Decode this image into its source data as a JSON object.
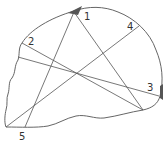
{
  "diagram": {
    "type": "skull-outline-with-measurement-lines",
    "labels": [
      {
        "id": "1",
        "text": "1",
        "x": 84,
        "y": 20
      },
      {
        "id": "2",
        "text": "2",
        "x": 28,
        "y": 45
      },
      {
        "id": "3",
        "text": "3",
        "x": 147,
        "y": 91
      },
      {
        "id": "4",
        "text": "4",
        "x": 127,
        "y": 30
      },
      {
        "id": "5",
        "text": "5",
        "x": 19,
        "y": 140
      }
    ],
    "colors": {
      "outline": "#666666",
      "lines": "#555555",
      "marks": "#555555"
    }
  }
}
